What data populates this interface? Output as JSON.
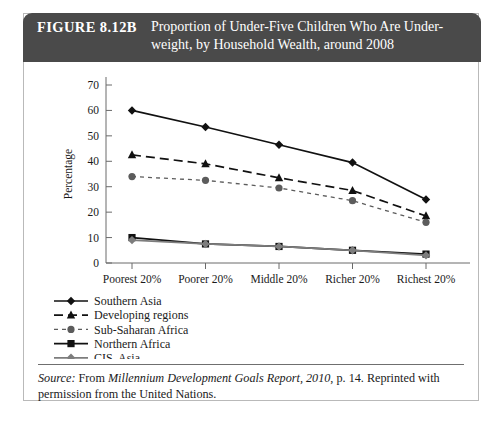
{
  "figure": {
    "number": "FIGURE 8.12B",
    "title_line1": "Proportion of Under-Five Children Who Are Under-",
    "title_line2": "weight, by Household Wealth, around 2008",
    "header_bg": "#4a4a4a",
    "header_text_color": "#ffffff"
  },
  "source": {
    "label": "Source:",
    "text_before": " From ",
    "italic_title": "Millennium Development Goals Report, 2010",
    "text_after": ", p. 14. Reprinted with permission from the United Nations."
  },
  "chart_data": {
    "type": "line",
    "xlabel": "",
    "ylabel": "Percentage",
    "categories": [
      "Poorest 20%",
      "Poorer 20%",
      "Middle 20%",
      "Richer 20%",
      "Richest 20%"
    ],
    "ylim": [
      0,
      70
    ],
    "yticks": [
      0,
      10,
      20,
      30,
      40,
      50,
      60,
      70
    ],
    "grid": false,
    "legend_position": "below-left",
    "series": [
      {
        "name": "Southern Asia",
        "values": [
          60,
          53.5,
          46.5,
          39.5,
          25
        ],
        "color": "#111111",
        "marker": "diamond",
        "dash": "none"
      },
      {
        "name": "Developing regions",
        "values": [
          42.5,
          39,
          33.5,
          28.5,
          18.5
        ],
        "color": "#111111",
        "marker": "triangle",
        "dash": "dashed"
      },
      {
        "name": "Sub-Saharan Africa",
        "values": [
          34,
          32.5,
          29.5,
          24.5,
          16
        ],
        "color": "#5c5c5c",
        "marker": "circle",
        "dash": "fine-dashed"
      },
      {
        "name": "Northern Africa",
        "values": [
          10,
          7.5,
          6.5,
          5,
          3.5
        ],
        "color": "#111111",
        "marker": "square",
        "dash": "none"
      },
      {
        "name": "CIS, Asia",
        "values": [
          9,
          7.5,
          6.5,
          5,
          3
        ],
        "color": "#7d7d7d",
        "marker": "diamond",
        "dash": "none"
      }
    ]
  }
}
